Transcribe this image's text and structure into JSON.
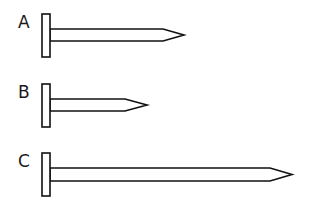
{
  "diagram": {
    "type": "nail-comparison",
    "colors": {
      "line": "#111111",
      "background": "#ffffff"
    },
    "nails": [
      {
        "label": "A",
        "head": {
          "x": 42,
          "y": 14,
          "w": 8,
          "h": 43
        },
        "shaft": {
          "top": 29,
          "bottom": 41,
          "taper_x": 163,
          "tip_x": 184
        }
      },
      {
        "label": "B",
        "head": {
          "x": 42,
          "y": 84,
          "w": 8,
          "h": 43
        },
        "shaft": {
          "top": 99,
          "bottom": 111,
          "taper_x": 125,
          "tip_x": 147
        }
      },
      {
        "label": "C",
        "head": {
          "x": 42,
          "y": 153,
          "w": 8,
          "h": 43
        },
        "shaft": {
          "top": 168,
          "bottom": 181,
          "taper_x": 270,
          "tip_x": 292
        }
      }
    ]
  }
}
